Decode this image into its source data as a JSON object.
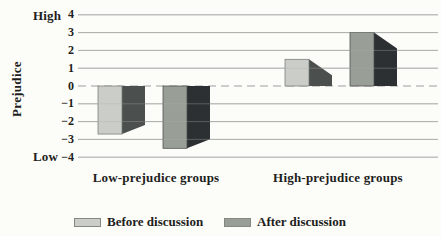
{
  "chart_data": {
    "type": "bar",
    "title": "",
    "categories": [
      "Low-prejudice groups",
      "High-prejudice groups"
    ],
    "series": [
      {
        "name": "Before discussion",
        "values": [
          -2.7,
          1.5
        ],
        "fill": "#cbcec8",
        "side": "#4b4f4e",
        "border": "#777b76"
      },
      {
        "name": "After discussion",
        "values": [
          -3.5,
          3.0
        ],
        "fill": "#999e97",
        "side": "#2c3032",
        "border": "#4a4e4b"
      }
    ],
    "ylabel": "Prejudice",
    "y_axis_top_label": "High",
    "y_axis_bottom_label": "Low",
    "ylim": [
      -4,
      4
    ],
    "yticks": [
      4,
      3,
      2,
      1,
      0,
      -1,
      -2,
      -3,
      -4
    ],
    "grid": true,
    "zero_line_dashed": true,
    "grid_color": "#abb0ad",
    "zero_line_color": "#9aa09c",
    "text_color": "#1e1e1c",
    "background": "#fcfcf9",
    "legend_position": "bottom"
  }
}
